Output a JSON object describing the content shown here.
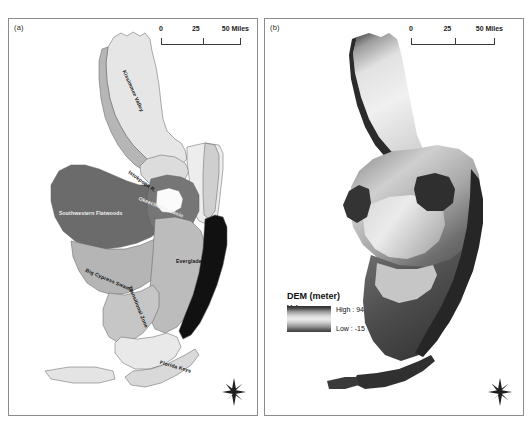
{
  "figure": {
    "panels": [
      {
        "id": "a",
        "label": "(a)",
        "type": "physiographic-region-map",
        "scalebar": {
          "zero": "0",
          "mid": "25",
          "max": "50 Miles",
          "units": "Miles"
        },
        "compass": "north-arrow",
        "regions": [
          {
            "name": "Kissimmee Valley",
            "fill": "#e3e3e3",
            "rotation": -66
          },
          {
            "name": "Istokpoga R.",
            "fill": "#dcdcdc",
            "rotation": -55
          },
          {
            "name": "Southwestern Flatwoods",
            "fill": "#6e6e6e",
            "rotation": 0
          },
          {
            "name": "Okeechobee Basin",
            "fill": "#747474",
            "rotation": -22
          },
          {
            "name": "Big Cypress Swamp",
            "fill": "#b4b4b4",
            "rotation": -23
          },
          {
            "name": "Everglades",
            "fill": "#b9b9b9",
            "rotation": 0
          },
          {
            "name": "Transitional Zone",
            "fill": "#c3c3c3",
            "rotation": -68
          },
          {
            "name": "Florida Keys",
            "fill": "#d7d7d7",
            "rotation": -16
          }
        ]
      },
      {
        "id": "b",
        "label": "(b)",
        "type": "dem-raster-map",
        "scalebar": {
          "zero": "0",
          "mid": "25",
          "max": "50 Miles",
          "units": "Miles"
        },
        "compass": "north-arrow",
        "legend": {
          "title": "DEM (meter)",
          "subtitle": "Value",
          "high_label": "High : 94",
          "low_label": "Low : -15",
          "high_value": 94,
          "low_value": -15,
          "ramp_top_color": "#2d2d2d",
          "ramp_mid_color": "#ececec",
          "ramp_bottom_color": "#3a3a3a"
        }
      }
    ]
  }
}
